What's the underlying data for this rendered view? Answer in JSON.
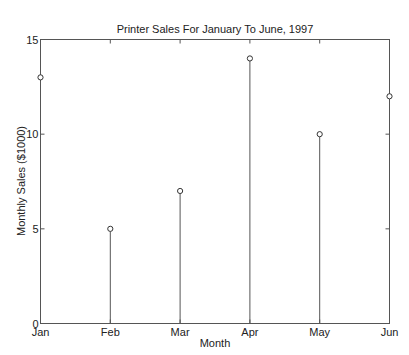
{
  "chart_data": {
    "type": "stem",
    "title": "Printer Sales For January To June, 1997",
    "xlabel": "Month",
    "ylabel": "Monthly Sales ($1000)",
    "categories": [
      "Jan",
      "Feb",
      "Mar",
      "Apr",
      "May",
      "Jun"
    ],
    "values": [
      13,
      5,
      7,
      14,
      10,
      12
    ],
    "ylim": [
      0,
      15
    ],
    "yticks": [
      0,
      5,
      10,
      15
    ],
    "ytick_labels": [
      "0",
      "5",
      "10",
      "15"
    ],
    "grid": false,
    "legend": null,
    "marker": "open-circle",
    "line_color": "#555555"
  }
}
